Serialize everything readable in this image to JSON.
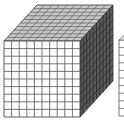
{
  "figure": {
    "grid_divisions": 10,
    "colors": {
      "background": "#ffffff",
      "front_face": "#ffffff",
      "top_face": "#c8c8c8",
      "right_face": "#5a5a5a",
      "grid_line": "#555555",
      "top_grid_line": "#6a6a6a",
      "right_grid_line": "#2a2a2a"
    },
    "partial_block": "Second cube partially visible at right edge"
  }
}
